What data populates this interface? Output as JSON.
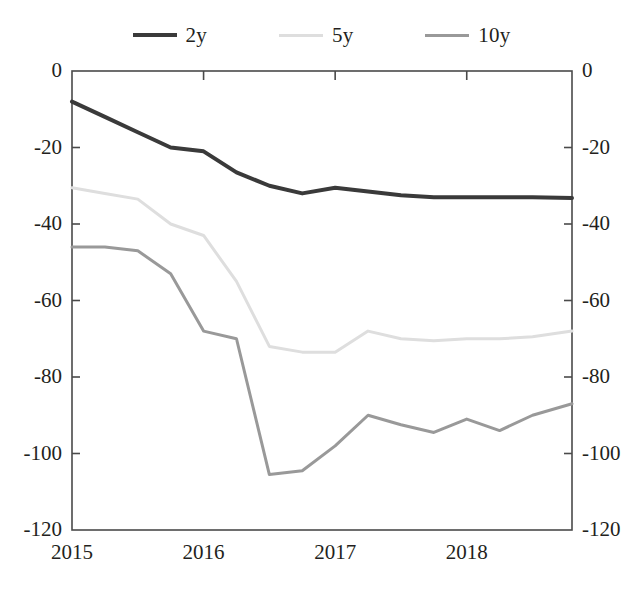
{
  "legend": {
    "position": "top-center",
    "entries": [
      {
        "label": "2y",
        "color": "#3a3a3a"
      },
      {
        "label": "5y",
        "color": "#dedede"
      },
      {
        "label": "10y",
        "color": "#999999"
      }
    ]
  },
  "axes": {
    "y_ticks": [
      "0",
      "-20",
      "-40",
      "-60",
      "-80",
      "-100",
      "-120"
    ],
    "y_ticks_right": [
      "0",
      "-20",
      "-40",
      "-60",
      "-80",
      "-100",
      "-120"
    ],
    "x_ticks": [
      "2015",
      "2016",
      "2017",
      "2018"
    ]
  },
  "chart_data": {
    "type": "line",
    "title": "",
    "subtitle": "",
    "xlabel": "",
    "ylabel": "",
    "xlim": [
      2015.0,
      2018.8
    ],
    "ylim": [
      -120,
      0
    ],
    "yticks": [
      0,
      -20,
      -40,
      -60,
      -80,
      -100,
      -120
    ],
    "xticks": [
      2015,
      2016,
      2017,
      2018
    ],
    "grid": false,
    "legend_position": "top-center",
    "dual_y_axis": true,
    "x": [
      2015.0,
      2015.25,
      2015.5,
      2015.75,
      2016.0,
      2016.25,
      2016.5,
      2016.75,
      2017.0,
      2017.25,
      2017.5,
      2017.75,
      2018.0,
      2018.25,
      2018.5,
      2018.8
    ],
    "series": [
      {
        "name": "2y",
        "color": "#3a3a3a",
        "width": 4,
        "values": [
          -8,
          -12,
          -16,
          -20,
          -21,
          -26.5,
          -30,
          -32,
          -30.5,
          -31.5,
          -32.5,
          -33,
          -33,
          -33,
          -33,
          -33.2
        ]
      },
      {
        "name": "5y",
        "color": "#dedede",
        "width": 3,
        "values": [
          -30.5,
          -32,
          -33.5,
          -40,
          -43,
          -55,
          -72,
          -73.5,
          -73.5,
          -68,
          -70,
          -70.5,
          -70,
          -70,
          -69.5,
          -68
        ]
      },
      {
        "name": "10y",
        "color": "#999999",
        "width": 3,
        "values": [
          -46,
          -46,
          -47,
          -53,
          -68,
          -70,
          -105.5,
          -104.5,
          -98,
          -90,
          -92.5,
          -94.5,
          -91,
          -94,
          -90,
          -87
        ]
      }
    ]
  }
}
